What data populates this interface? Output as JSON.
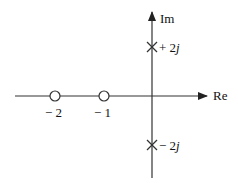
{
  "diagram": {
    "type": "pole-zero plot",
    "axes": {
      "real_label": "Re",
      "imag_label": "Im"
    },
    "zeros": [
      {
        "label": "− 2",
        "value": -2
      },
      {
        "label": "− 1",
        "value": -1
      }
    ],
    "poles": [
      {
        "prefix": "+ 2",
        "suffix": "j",
        "value": "+2j"
      },
      {
        "prefix": "− 2",
        "suffix": "j",
        "value": "-2j"
      }
    ],
    "colors": {
      "line": "#333333",
      "background": "#ffffff"
    }
  }
}
